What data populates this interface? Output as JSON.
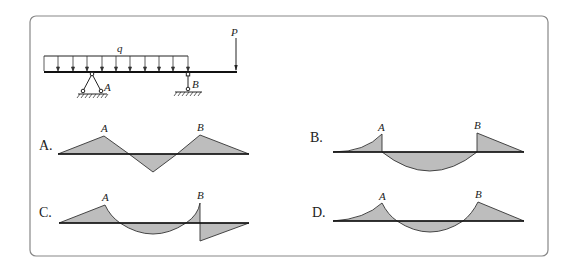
{
  "problem": {
    "beam": {
      "load_label": "q",
      "force_label": "P",
      "support_a_label": "A",
      "support_b_label": "B"
    },
    "options": [
      {
        "letter": "A.",
        "left_label": "A",
        "right_label": "B"
      },
      {
        "letter": "B.",
        "left_label": "A",
        "right_label": "B"
      },
      {
        "letter": "C.",
        "left_label": "A",
        "right_label": "B"
      },
      {
        "letter": "D.",
        "left_label": "A",
        "right_label": "B"
      }
    ]
  },
  "colors": {
    "diagram_fill": "#bdbdbd",
    "line": "#111111",
    "frame": "#888888"
  }
}
